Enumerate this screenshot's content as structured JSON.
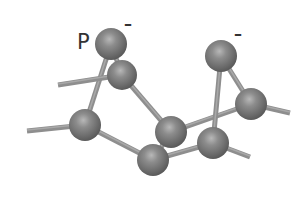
{
  "diagram": {
    "type": "ball-and-stick molecular model",
    "background": "#ffffff",
    "atom_color": "#7a7a7a",
    "bond_color": "#8e8e8e",
    "labels": [
      {
        "id": "phosphorus-label",
        "text": "P",
        "x": 77,
        "y": 32
      },
      {
        "id": "charge-left",
        "text": "–",
        "x": 124,
        "y": 16
      },
      {
        "id": "charge-right",
        "text": "–",
        "x": 234,
        "y": 26
      }
    ],
    "atoms": [
      {
        "id": "A",
        "x": 111,
        "y": 44,
        "r": 16
      },
      {
        "id": "B",
        "x": 122,
        "y": 75,
        "r": 15
      },
      {
        "id": "C",
        "x": 85,
        "y": 125,
        "r": 16
      },
      {
        "id": "D",
        "x": 171,
        "y": 132,
        "r": 16
      },
      {
        "id": "E",
        "x": 153,
        "y": 160,
        "r": 16
      },
      {
        "id": "F",
        "x": 213,
        "y": 143,
        "r": 16
      },
      {
        "id": "G",
        "x": 221,
        "y": 56,
        "r": 16
      },
      {
        "id": "H",
        "x": 251,
        "y": 104,
        "r": 16
      }
    ],
    "bonds": [
      {
        "from": [
          85,
          125
        ],
        "to": [
          27,
          131
        ]
      },
      {
        "from": [
          85,
          125
        ],
        "to": [
          153,
          160
        ]
      },
      {
        "from": [
          111,
          44
        ],
        "to": [
          85,
          125
        ]
      },
      {
        "from": [
          111,
          44
        ],
        "to": [
          122,
          75
        ]
      },
      {
        "from": [
          122,
          75
        ],
        "to": [
          58,
          85
        ]
      },
      {
        "from": [
          122,
          75
        ],
        "to": [
          171,
          132
        ]
      },
      {
        "from": [
          153,
          160
        ],
        "to": [
          171,
          132
        ]
      },
      {
        "from": [
          153,
          160
        ],
        "to": [
          213,
          143
        ]
      },
      {
        "from": [
          171,
          132
        ],
        "to": [
          251,
          104
        ]
      },
      {
        "from": [
          221,
          56
        ],
        "to": [
          213,
          143
        ]
      },
      {
        "from": [
          221,
          56
        ],
        "to": [
          251,
          104
        ]
      },
      {
        "from": [
          251,
          104
        ],
        "to": [
          290,
          113
        ]
      },
      {
        "from": [
          213,
          143
        ],
        "to": [
          250,
          157
        ]
      }
    ]
  }
}
